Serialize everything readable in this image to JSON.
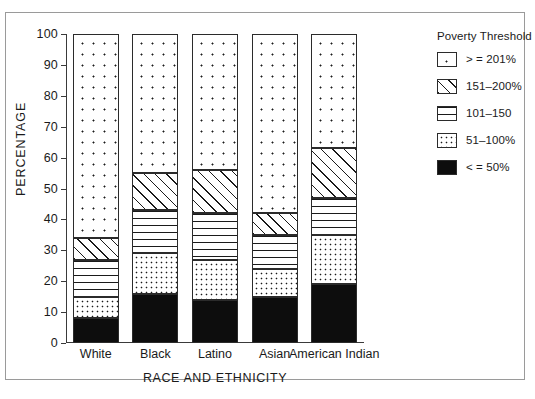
{
  "chart_data": {
    "type": "bar",
    "subtype": "stacked-percentage",
    "title": "",
    "xlabel": "RACE AND ETHNICITY",
    "ylabel": "PERCENTAGE",
    "ylim": [
      0,
      100
    ],
    "ytick_step": 10,
    "yticks": [
      0,
      10,
      20,
      30,
      40,
      50,
      60,
      70,
      80,
      90,
      100
    ],
    "grid": false,
    "legend_position": "right",
    "legend_title": "Poverty Threshold",
    "categories": [
      "White",
      "Black",
      "Latino",
      "Asian",
      "American Indian"
    ],
    "series": [
      {
        "name": "< = 50%",
        "pattern": "solid-black",
        "values": [
          8,
          16,
          14,
          15,
          19
        ]
      },
      {
        "name": "51–100%",
        "pattern": "dense-dots",
        "values": [
          7,
          13,
          13,
          9,
          16
        ]
      },
      {
        "name": "101–150",
        "pattern": "horizontal-lines",
        "values": [
          12,
          14,
          15,
          11,
          12
        ]
      },
      {
        "name": "151–200%",
        "pattern": "diagonal-hatch",
        "values": [
          7,
          12,
          14,
          7,
          16
        ]
      },
      {
        "name": "> = 201%",
        "pattern": "sparse-dots",
        "values": [
          66,
          45,
          44,
          58,
          37
        ]
      }
    ],
    "cumulative_tops": {
      "White": [
        8,
        15,
        27,
        34,
        100
      ],
      "Black": [
        16,
        29,
        43,
        55,
        100
      ],
      "Latino": [
        14,
        27,
        42,
        56,
        100
      ],
      "Asian": [
        15,
        24,
        35,
        42,
        100
      ],
      "American Indian": [
        19,
        35,
        47,
        63,
        100
      ]
    }
  },
  "legend": {
    "title": "Poverty Threshold",
    "items": [
      {
        "label": "> = 201%",
        "pattern": "sparse-dots"
      },
      {
        "label": "151–200%",
        "pattern": "diagonal-hatch"
      },
      {
        "label": "101–150",
        "pattern": "horizontal-lines"
      },
      {
        "label": "51–100%",
        "pattern": "dense-dots"
      },
      {
        "label": "< = 50%",
        "pattern": "solid-black"
      }
    ]
  }
}
